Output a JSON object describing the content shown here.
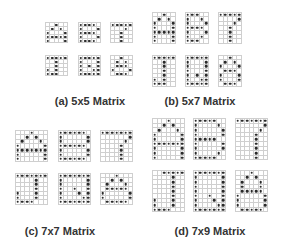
{
  "panels": [
    {
      "id": "a",
      "label": "(a) 5x5 Matrix",
      "cols": 5,
      "rows": 5,
      "cell_w": 4.4,
      "cell_h": 4.0,
      "label_pos": [
        90,
        95
      ],
      "glyphs": [
        {
          "name": "A",
          "pos": [
            45,
            22
          ],
          "pattern": [
            "..#..",
            ".#.#.",
            "#...#",
            "#####",
            "#...#"
          ]
        },
        {
          "name": "B",
          "pos": [
            78,
            22
          ],
          "pattern": [
            "####.",
            "#...#",
            "####.",
            "#...#",
            "####."
          ]
        },
        {
          "name": "7",
          "pos": [
            110,
            22
          ],
          "pattern": [
            "#####",
            "...#.",
            "..#..",
            "..#..",
            "..#.."
          ]
        },
        {
          "name": "J",
          "pos": [
            45,
            55
          ],
          "pattern": [
            "#####",
            "..#..",
            "..#..",
            "#.#..",
            "###.."
          ]
        },
        {
          "name": "Q",
          "pos": [
            78,
            55
          ],
          "pattern": [
            "#####",
            "#...#",
            "#.#.#",
            "#..##",
            "#####"
          ]
        },
        {
          "name": "&",
          "pos": [
            110,
            55
          ],
          "pattern": [
            "..#..",
            ".#.#.",
            ".###.",
            "#...#",
            ".###."
          ]
        }
      ]
    },
    {
      "id": "b",
      "label": "(b) 5x7 Matrix",
      "cols": 5,
      "rows": 7,
      "cell_w": 4.6,
      "cell_h": 4.4,
      "label_pos": [
        200,
        95
      ],
      "glyphs": [
        {
          "name": "A",
          "pos": [
            152,
            12
          ],
          "pattern": [
            "..#..",
            ".#.#.",
            "#...#",
            "#...#",
            "#####",
            "#...#",
            "#...#"
          ]
        },
        {
          "name": "B",
          "pos": [
            185,
            12
          ],
          "pattern": [
            "###..",
            "#..#.",
            "#...#",
            "####.",
            "#...#",
            "#..#.",
            "###.."
          ]
        },
        {
          "name": "7",
          "pos": [
            218,
            12
          ],
          "pattern": [
            "#####",
            "....#",
            "...#.",
            "..#..",
            "..#..",
            "..#..",
            "..#.."
          ]
        },
        {
          "name": "J",
          "pos": [
            152,
            55
          ],
          "pattern": [
            "#####",
            "..#..",
            "..#..",
            "..#..",
            "..#..",
            "#.#..",
            "###.."
          ]
        },
        {
          "name": "Q",
          "pos": [
            185,
            55
          ],
          "pattern": [
            "#####",
            "#...#",
            "#...#",
            "#...#",
            "#.#.#",
            "#..##",
            "#####"
          ]
        },
        {
          "name": "&",
          "pos": [
            218,
            55
          ],
          "pattern": [
            "..#..",
            ".#.#.",
            "#...#",
            ".###.",
            "#...#",
            "#...#",
            ".###."
          ]
        }
      ]
    },
    {
      "id": "c",
      "label": "(c) 7x7 Matrix",
      "cols": 7,
      "rows": 7,
      "cell_w": 4.6,
      "cell_h": 4.4,
      "label_pos": [
        60,
        225
      ],
      "glyphs": [
        {
          "name": "A",
          "pos": [
            15,
            130
          ],
          "pattern": [
            "...#...",
            "..#.#..",
            ".#...#.",
            "#.....#",
            "#######",
            "#.....#",
            "#.....#"
          ]
        },
        {
          "name": "B",
          "pos": [
            58,
            130
          ],
          "pattern": [
            "######.",
            "#.....#",
            "#.....#",
            "######.",
            "#.....#",
            "#.....#",
            "######."
          ]
        },
        {
          "name": "7",
          "pos": [
            100,
            130
          ],
          "pattern": [
            "#######",
            "......#",
            ".....#.",
            "....#..",
            "....#..",
            "....#..",
            "....#.."
          ]
        },
        {
          "name": "J",
          "pos": [
            15,
            173
          ],
          "pattern": [
            "#######",
            "....#..",
            "....#..",
            "....#..",
            "#...#..",
            "#...#..",
            "####..."
          ]
        },
        {
          "name": "Q",
          "pos": [
            58,
            173
          ],
          "pattern": [
            "#######",
            "#.....#",
            "#.....#",
            "#..#..#",
            "#...#.#",
            "#....##",
            "#######"
          ]
        },
        {
          "name": "&",
          "pos": [
            100,
            173
          ],
          "pattern": [
            "...#...",
            "..#.#..",
            ".#...#.",
            ".#####.",
            "#.....#",
            "#.....#",
            ".#####."
          ]
        }
      ]
    },
    {
      "id": "d",
      "label": "(d) 7x9 Matrix",
      "cols": 7,
      "rows": 9,
      "cell_w": 4.6,
      "cell_h": 4.6,
      "label_pos": [
        210,
        225
      ],
      "glyphs": [
        {
          "name": "A",
          "pos": [
            152,
            118
          ],
          "pattern": [
            "...#...",
            "..#.#..",
            ".#...#.",
            "#.....#",
            "#.....#",
            "#######",
            "#.....#",
            "#.....#",
            "#.....#"
          ]
        },
        {
          "name": "B",
          "pos": [
            193,
            118
          ],
          "pattern": [
            "#####..",
            "#....#.",
            "#.....#",
            "#.....#",
            "#####..",
            "#.....#",
            "#.....#",
            "#....#.",
            "#####.."
          ]
        },
        {
          "name": "7",
          "pos": [
            235,
            118
          ],
          "pattern": [
            "#######",
            "......#",
            ".....#.",
            "....#..",
            "....#..",
            "....#..",
            "....#..",
            "....#..",
            "....#.."
          ]
        },
        {
          "name": "J",
          "pos": [
            152,
            170
          ],
          "pattern": [
            "..#####",
            "....#..",
            "....#..",
            "....#..",
            "....#..",
            "....#..",
            "#...#..",
            "#...#..",
            "####..."
          ]
        },
        {
          "name": "Q",
          "pos": [
            193,
            170
          ],
          "pattern": [
            "#######",
            "#.....#",
            "#.....#",
            "#.....#",
            "#.....#",
            "#..#..#",
            "#...#.#",
            "#....##",
            "#######"
          ]
        },
        {
          "name": "&",
          "pos": [
            235,
            170
          ],
          "pattern": [
            "...#...",
            "..#.#..",
            ".#...#.",
            ".#...#.",
            ".#####.",
            "#.....#",
            "#.....#",
            "#.....#",
            ".#####."
          ]
        }
      ]
    }
  ]
}
